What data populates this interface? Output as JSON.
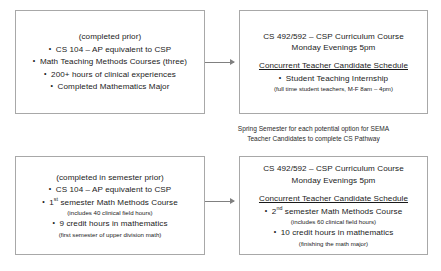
{
  "diagram": {
    "caption": {
      "line1": "Spring Semester for each potential option for SEMA",
      "line2": "Teacher Candidates to complete CS Pathway"
    },
    "colors": {
      "box_border": "#a8a8a8",
      "arrow": "#808080",
      "text": "#1a1a1a",
      "background": "#ffffff"
    },
    "rows": [
      {
        "id": "option-1",
        "prerequisite_box": {
          "heading": "(completed prior)",
          "items": [
            "CS 104 – AP equivalent to CSP",
            "Math Teaching Methods Courses (three)",
            "200+ hours of clinical experiences",
            "Completed Mathematics Major"
          ]
        },
        "semester_box": {
          "course_line1": "CS 492/592 – CSP Curriculum Course",
          "course_line2": "Monday Evenings 5pm",
          "schedule_heading": "Concurrent Teacher Candidate Schedule",
          "schedule_item": "Student Teaching Internship",
          "schedule_note": "(full time student teachers, M-F 8am – 4pm)"
        },
        "arrow": "arrow-right"
      },
      {
        "id": "option-2",
        "prerequisite_box": {
          "heading": "(completed in semester prior)",
          "item1": "CS 104 – AP equivalent to CSP",
          "item2_num": "1",
          "item2_sup": "st",
          "item2_rest": " semester Math Methods Course",
          "item2_note": "(includes 40 clinical field hours)",
          "item3": "9 credit hours in mathematics",
          "item3_note": "(first semester of upper division math)"
        },
        "semester_box": {
          "course_line1": "CS 492/592 – CSP Curriculum Course",
          "course_line2": "Monday Evenings 5pm",
          "schedule_heading": "Concurrent Teacher Candidate Schedule",
          "item1_num": "2",
          "item1_sup": "nd",
          "item1_rest": " semester Math Methods Course",
          "item1_note": "(includes 60 clinical field hours)",
          "item2": "10 credit hours in mathematics",
          "item2_note": "(finishing the math major)"
        },
        "arrow": "arrow-right"
      }
    ]
  }
}
